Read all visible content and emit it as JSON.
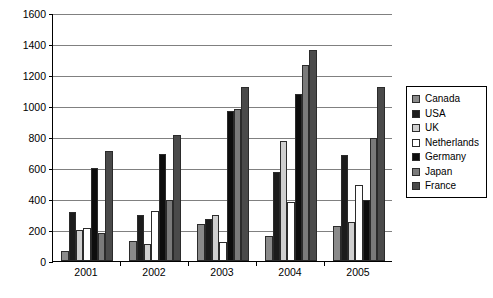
{
  "chart_data": {
    "type": "bar",
    "title": "",
    "subtitle": "",
    "xlabel": "",
    "ylabel": "",
    "categories": [
      "2001",
      "2002",
      "2003",
      "2004",
      "2005"
    ],
    "ylim": [
      0,
      1600
    ],
    "ytick_labels": [
      "1600",
      "1400",
      "1200",
      "1000",
      "800",
      "600",
      "400",
      "200",
      "0"
    ],
    "ytick_values": [
      1600,
      1400,
      1200,
      1000,
      800,
      600,
      400,
      200,
      0
    ],
    "ytick_step": 200,
    "grid": true,
    "legend_position": "right",
    "series": [
      {
        "name": "Canada",
        "color": "#8a8a8a",
        "values": [
          65,
          130,
          240,
          160,
          225
        ]
      },
      {
        "name": "USA",
        "color": "#1c1c1c",
        "values": [
          315,
          295,
          270,
          575,
          685
        ]
      },
      {
        "name": "UK",
        "color": "#cfcfcf",
        "values": [
          200,
          110,
          300,
          775,
          250
        ]
      },
      {
        "name": "Netherlands",
        "color": "#ffffff",
        "values": [
          210,
          325,
          120,
          380,
          490
        ]
      },
      {
        "name": "Germany",
        "color": "#0d0d0d",
        "values": [
          600,
          690,
          970,
          1080,
          395
        ]
      },
      {
        "name": "Japan",
        "color": "#7a7a7a",
        "values": [
          180,
          395,
          980,
          1265,
          795
        ]
      },
      {
        "name": "France",
        "color": "#4a4a4a",
        "values": [
          710,
          810,
          1120,
          1360,
          1125
        ]
      }
    ]
  },
  "legend": {
    "items": [
      {
        "label": "Canada"
      },
      {
        "label": "USA"
      },
      {
        "label": "UK"
      },
      {
        "label": "Netherlands"
      },
      {
        "label": "Germany"
      },
      {
        "label": "Japan"
      },
      {
        "label": "France"
      }
    ]
  },
  "colors": {
    "axis": "#000000",
    "gridline": "#808080",
    "background": "#ffffff",
    "bar_outline": "#2b2b2b"
  }
}
